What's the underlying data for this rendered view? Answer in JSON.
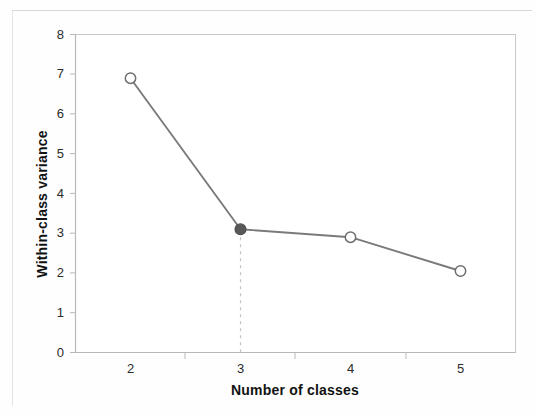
{
  "chart_data": {
    "type": "line",
    "title": "",
    "xlabel": "Number of classes",
    "ylabel": "Within-class variance",
    "x": [
      2,
      3,
      4,
      5
    ],
    "categories": [
      "2",
      "3",
      "4",
      "5"
    ],
    "values": [
      6.9,
      3.1,
      2.9,
      2.05
    ],
    "series": [
      {
        "name": "Within-class variance",
        "values": [
          6.9,
          3.1,
          2.9,
          2.05
        ]
      }
    ],
    "xlim": [
      1.5,
      5.5
    ],
    "ylim": [
      0,
      8
    ],
    "xticks": [
      "2",
      "3",
      "4",
      "5"
    ],
    "yticks": [
      "0",
      "1",
      "2",
      "3",
      "4",
      "5",
      "6",
      "7",
      "8"
    ],
    "grid": false,
    "legend": null,
    "legend_position": "none",
    "marker_styles": [
      "open-circle",
      "filled-circle",
      "open-circle",
      "open-circle"
    ],
    "highlighted_point": {
      "x": "3",
      "y": 3.1,
      "marker": "filled-circle",
      "annotation": "dashed-drop-line"
    },
    "colors": {
      "line": "#7a7a7a",
      "marker_open_fill": "#ffffff",
      "marker_edge": "#6e6e6e",
      "marker_filled": "#595959",
      "axis": "#b9b9b9",
      "plot_border": "#c9c9c9",
      "drop_line": "#c2c2c2",
      "text": "#121212",
      "background": "#ffffff"
    }
  }
}
